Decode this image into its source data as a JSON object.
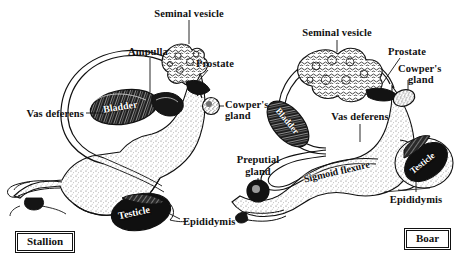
{
  "figure": {
    "background_color": "#ffffff",
    "ink_color": "#111111",
    "panels": [
      {
        "id": "stallion",
        "species_label": "Stallion",
        "labels": [
          {
            "name": "seminal-vesicle",
            "text": "Seminal vesicle"
          },
          {
            "name": "ampulla",
            "text": "Ampulla"
          },
          {
            "name": "prostate",
            "text": "Prostate"
          },
          {
            "name": "cowpers-gland-1",
            "text": "Cowper's"
          },
          {
            "name": "cowpers-gland-2",
            "text": "gland"
          },
          {
            "name": "vas-deferens",
            "text": "Vas deferens"
          },
          {
            "name": "epididymis",
            "text": "Epididymis"
          }
        ],
        "organ_texts": [
          {
            "name": "bladder",
            "text": "Bladder"
          },
          {
            "name": "testicle",
            "text": "Testicle"
          }
        ]
      },
      {
        "id": "boar",
        "species_label": "Boar",
        "labels": [
          {
            "name": "seminal-vesicle",
            "text": "Seminal vesicle"
          },
          {
            "name": "prostate",
            "text": "Prostate"
          },
          {
            "name": "cowpers-gland-1",
            "text": "Cowper's"
          },
          {
            "name": "cowpers-gland-2",
            "text": "gland"
          },
          {
            "name": "vas-deferens",
            "text": "Vas deferens"
          },
          {
            "name": "preputial-gland-1",
            "text": "Preputial"
          },
          {
            "name": "preputial-gland-2",
            "text": "gland"
          },
          {
            "name": "epididymis",
            "text": "Epididymis"
          }
        ],
        "organ_texts": [
          {
            "name": "bladder",
            "text": "Bladder"
          },
          {
            "name": "sigmoid-flexure",
            "text": "Sigmoid flexure"
          },
          {
            "name": "testicle",
            "text": "Testicle"
          }
        ]
      }
    ]
  }
}
